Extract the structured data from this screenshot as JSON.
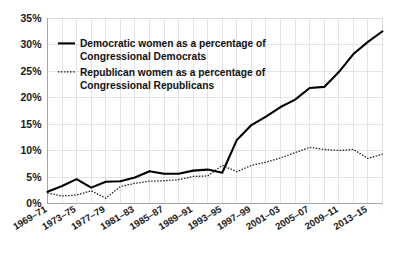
{
  "chart_data": {
    "type": "line",
    "title": "",
    "xlabel": "",
    "ylabel": "",
    "ylim": [
      0,
      35
    ],
    "yticks": [
      0,
      5,
      10,
      15,
      20,
      25,
      30,
      35
    ],
    "ytick_labels": [
      "0%",
      "5%",
      "10%",
      "15%",
      "20%",
      "25%",
      "30%",
      "35%"
    ],
    "grid": true,
    "legend_position": "upper-left",
    "x": [
      "1969–71",
      "1971–73",
      "1973–75",
      "1975–77",
      "1977–79",
      "1979–81",
      "1981–83",
      "1983–85",
      "1985–87",
      "1987–89",
      "1989–91",
      "1991–93",
      "1993–95",
      "1995–97",
      "1997–99",
      "1999–01",
      "2001–03",
      "2003–05",
      "2005–07",
      "2007–09",
      "2009–11",
      "2011–13",
      "2013–15",
      "2015–17"
    ],
    "xtick_labels": [
      "1969–71",
      "1973–75",
      "1977–79",
      "1981–83",
      "1985–87",
      "1989–91",
      "1993–95",
      "1997–99",
      "2001–03",
      "2005–07",
      "2009–11",
      "2013–15"
    ],
    "series": [
      {
        "name": "Democratic women as a percentage of Congressional Democrats",
        "style": "solid",
        "color": "#000000",
        "values": [
          2.2,
          3.3,
          4.6,
          3.0,
          4.1,
          4.2,
          4.9,
          6.1,
          5.6,
          5.6,
          6.2,
          6.4,
          5.8,
          12.0,
          14.8,
          16.4,
          18.2,
          19.6,
          21.8,
          22.0,
          24.8,
          28.2,
          30.5,
          32.5
        ]
      },
      {
        "name": "Republican women as a percentage of Congressional Republicans",
        "style": "dotted",
        "color": "#1a1a1a",
        "values": [
          2.0,
          1.4,
          1.6,
          2.4,
          1.0,
          3.2,
          3.8,
          4.2,
          4.3,
          4.5,
          5.1,
          5.2,
          7.2,
          6.0,
          7.2,
          7.8,
          8.6,
          9.6,
          10.6,
          10.2,
          10.0,
          10.2,
          8.5,
          9.3
        ]
      }
    ],
    "legend": [
      {
        "line1": "Democratic women as a percentage of",
        "line2": "Congressional Democrats",
        "style": "solid"
      },
      {
        "line1": "Republican women as a percentage of",
        "line2": "Congressional Republicans",
        "style": "dotted"
      }
    ]
  }
}
